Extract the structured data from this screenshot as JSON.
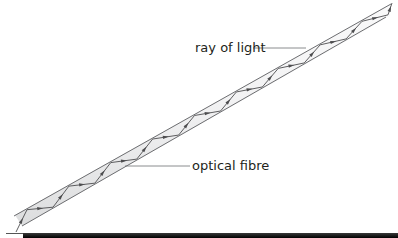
{
  "diagram": {
    "labels": {
      "ray": "ray of light",
      "fibre": "optical fibre"
    },
    "reflections": 9,
    "colors": {
      "fibre_edge": "#6d6e71",
      "fibre_fill": "#e8e9ea",
      "ray": "#4d4d4f",
      "text": "#231f20"
    }
  }
}
